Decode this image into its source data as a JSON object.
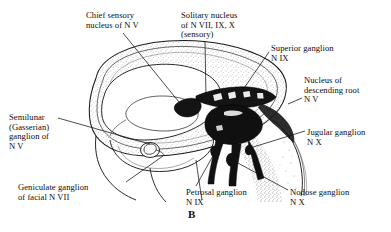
{
  "figure": {
    "id": "B",
    "colors": {
      "outline": "#1a1a1a",
      "nuclei_dark": "#111111",
      "stipple": "#6b6b6b",
      "background": "#ffffff"
    }
  },
  "labels": [
    {
      "name": "chief-sensory-nucleus-n-v",
      "lines": [
        "Chief sensory",
        "nucleus of N V"
      ],
      "x": 86,
      "y": 11,
      "align": "left"
    },
    {
      "name": "solitary-nucleus-n-vii-ix-x",
      "lines": [
        "Solitary nucleus",
        "of N VII, IX, X",
        "(sensory)"
      ],
      "x": 181,
      "y": 11,
      "align": "left"
    },
    {
      "name": "superior-ganglion-n-ix",
      "lines": [
        "Superior ganglion",
        "N IX"
      ],
      "x": 271,
      "y": 44,
      "align": "left"
    },
    {
      "name": "nucleus-of-descending-root-n-v",
      "lines": [
        "Nucleus of",
        "descending root",
        "N V"
      ],
      "x": 304,
      "y": 76,
      "align": "left"
    },
    {
      "name": "jugular-ganglion-n-x",
      "lines": [
        "Jugular ganglion",
        "N X"
      ],
      "x": 307,
      "y": 128,
      "align": "left"
    },
    {
      "name": "semilunar-gasserian-ganglion-n-v",
      "lines": [
        "Semilunar",
        "(Gasserian)",
        "ganglion of",
        "N V"
      ],
      "x": 9,
      "y": 113,
      "align": "left"
    },
    {
      "name": "geniculate-ganglion-facial-n-vii",
      "lines": [
        "Geniculate ganglion",
        "of facial N VII"
      ],
      "x": 18,
      "y": 183,
      "align": "left"
    },
    {
      "name": "petrosal-ganglion-n-ix",
      "lines": [
        "Petrosal ganglion",
        "N IX"
      ],
      "x": 186,
      "y": 188,
      "align": "left"
    },
    {
      "name": "nodose-ganglion-n-x",
      "lines": [
        "Nodose ganglion",
        "N X"
      ],
      "x": 290,
      "y": 188,
      "align": "left"
    }
  ],
  "figure_caption": {
    "text": "B",
    "x": 188,
    "y": 208
  }
}
